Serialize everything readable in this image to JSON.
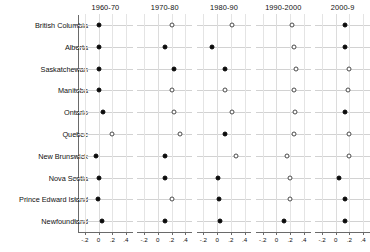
{
  "chart_data": {
    "type": "scatter",
    "title": "",
    "xlabel": "",
    "ylabel": "",
    "layout": "small-multiples dot plot, 5 panels by decade, 10 rows by province",
    "grid": true,
    "legend": "none",
    "xlim": [
      -0.3,
      0.5
    ],
    "xticks": [
      -0.2,
      0,
      0.2,
      0.4
    ],
    "xticklabels": [
      "-.2",
      "0",
      ".2",
      ".4"
    ],
    "panels": [
      "1960-70",
      "1970-80",
      "1980-90",
      "1990-2000",
      "2000-9"
    ],
    "categories": [
      "British Columbia",
      "Alberta",
      "Saskatchewan",
      "Manitoba",
      "Ontario",
      "Quebec",
      "New Brunswick",
      "Nova Scotia",
      "Prince Edward Island",
      "Newfoundland"
    ],
    "marker_styles": {
      "filled": "solid black circle",
      "hollow": "open white circle"
    },
    "series": [
      {
        "name": "1960-70",
        "values": [
          0.0,
          0.0,
          0.0,
          0.0,
          0.07,
          0.2,
          -0.03,
          0.0,
          -0.01,
          0.05
        ],
        "markers": [
          "filled",
          "filled",
          "filled",
          "filled",
          "filled",
          "hollow",
          "filled",
          "filled",
          "filled",
          "filled"
        ]
      },
      {
        "name": "1970-80",
        "values": [
          0.2,
          0.1,
          0.23,
          0.2,
          0.24,
          0.32,
          0.1,
          0.1,
          0.21,
          0.11
        ],
        "markers": [
          "hollow",
          "filled",
          "filled",
          "hollow",
          "hollow",
          "hollow",
          "filled",
          "filled",
          "hollow",
          "filled"
        ]
      },
      {
        "name": "1980-90",
        "values": [
          0.21,
          -0.08,
          0.11,
          0.11,
          0.21,
          0.12,
          0.27,
          0.01,
          0.03,
          0.04
        ],
        "markers": [
          "hollow",
          "filled",
          "filled",
          "hollow",
          "hollow",
          "filled",
          "hollow",
          "filled",
          "filled",
          "filled"
        ]
      },
      {
        "name": "1990-2000",
        "values": [
          0.23,
          0.26,
          0.28,
          0.26,
          0.27,
          0.25,
          0.15,
          0.2,
          0.2,
          0.11
        ],
        "markers": [
          "hollow",
          "hollow",
          "hollow",
          "hollow",
          "hollow",
          "hollow",
          "hollow",
          "hollow",
          "hollow",
          "filled"
        ]
      },
      {
        "name": "2000-9",
        "values": [
          0.13,
          0.13,
          0.19,
          0.18,
          0.13,
          0.2,
          0.19,
          0.05,
          0.13,
          0.13
        ],
        "markers": [
          "filled",
          "filled",
          "hollow",
          "hollow",
          "filled",
          "hollow",
          "hollow",
          "filled",
          "filled",
          "filled"
        ]
      }
    ]
  },
  "colors": {
    "filled_marker": "#0b0b0b",
    "hollow_marker_border": "#4a4a4a",
    "hgrid": "#d2d2d2",
    "vgrid": "#e4e4e4",
    "axis": "#6a6a6a",
    "text": "#111111",
    "background": "#ffffff"
  }
}
